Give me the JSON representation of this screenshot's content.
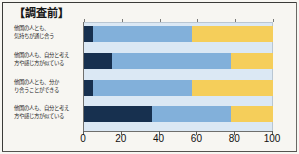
{
  "title": "【調査前】",
  "colors": {
    "series_dark": "#17304f",
    "series_blue": "#82b0da",
    "series_yellow": "#f5ce5a",
    "plot_background": "#dbe8f4",
    "page_background": "#f7f6f2"
  },
  "axis": {
    "ticks": [
      "0",
      "20",
      "40",
      "60",
      "80",
      "100"
    ],
    "min": 0,
    "max": 100
  },
  "categories": [
    {
      "line1": "他国の人とも、",
      "line2": "気持ちが通じ合う"
    },
    {
      "line1": "他国の人も、自分と考え",
      "line2": "方や感じ方が似ている"
    },
    {
      "line1": "他国の人とも、分か",
      "line2": "り合うことができる"
    },
    {
      "line1": "他国の人も、自分と考え",
      "line2": "方や感じ方が似ている"
    }
  ],
  "chart_data": {
    "type": "bar",
    "orientation": "horizontal",
    "stacked": true,
    "stacked_percent": true,
    "title": "【調査前】",
    "xlabel": "",
    "ylabel": "",
    "xlim": [
      0,
      100
    ],
    "xticks": [
      0,
      20,
      40,
      60,
      80,
      100
    ],
    "grid": false,
    "legend": "none",
    "categories": [
      "他国の人とも、気持ちが通じ合う",
      "他国の人も、自分と考え方や感じ方が似ている",
      "他国の人とも、分かり合うことができる",
      "他国の人も、自分と考え方や感じ方が似ている"
    ],
    "series": [
      {
        "name": "series-1",
        "color": "#17304f",
        "values": [
          5,
          15,
          5,
          36
        ]
      },
      {
        "name": "series-2",
        "color": "#82b0da",
        "values": [
          52,
          63,
          52,
          42
        ]
      },
      {
        "name": "series-3",
        "color": "#f5ce5a",
        "values": [
          43,
          22,
          43,
          22
        ]
      }
    ],
    "cumulative_boundaries": [
      [
        5,
        57
      ],
      [
        15,
        78
      ],
      [
        5,
        57
      ],
      [
        36,
        78
      ]
    ]
  }
}
